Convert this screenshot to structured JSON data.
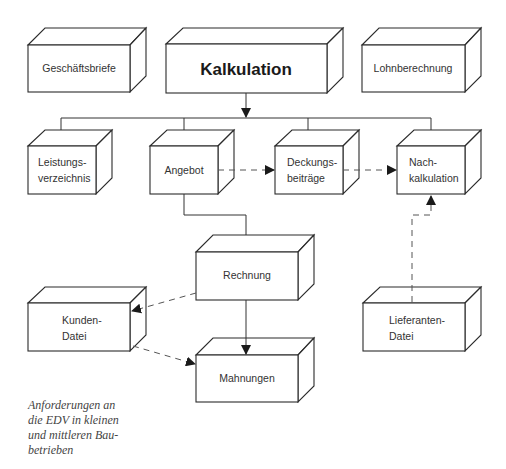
{
  "diagram": {
    "title": "Kalkulation",
    "boxes": {
      "geschaeftsbriefe": {
        "label": "Geschäftsbriefe"
      },
      "kalkulation": {
        "label": "Kalkulation"
      },
      "lohnberechnung": {
        "label": "Lohnberechnung"
      },
      "leistungsverzeichnis": {
        "line1": "Leistungs-",
        "line2": "verzeichnis"
      },
      "angebot": {
        "label": "Angebot"
      },
      "deckungsbeitraege": {
        "line1": "Deckungs-",
        "line2": "beiträge"
      },
      "nachkalkulation": {
        "line1": "Nach-",
        "line2": "kalkulation"
      },
      "rechnung": {
        "label": "Rechnung"
      },
      "kundendatei": {
        "line1": "Kunden-",
        "line2": "Datei"
      },
      "lieferantendatei": {
        "line1": "Lieferanten-",
        "line2": "Datei"
      },
      "mahnungen": {
        "label": "Mahnungen"
      }
    },
    "edges": [
      {
        "from": "Kalkulation",
        "to": "Leistungsverzeichnis",
        "style": "solid"
      },
      {
        "from": "Kalkulation",
        "to": "Angebot",
        "style": "solid"
      },
      {
        "from": "Kalkulation",
        "to": "Deckungsbeiträge",
        "style": "solid"
      },
      {
        "from": "Kalkulation",
        "to": "Nachkalkulation",
        "style": "solid"
      },
      {
        "from": "Angebot",
        "to": "Deckungsbeiträge",
        "style": "dashed"
      },
      {
        "from": "Deckungsbeiträge",
        "to": "Nachkalkulation",
        "style": "dashed"
      },
      {
        "from": "Angebot",
        "to": "Rechnung",
        "style": "solid"
      },
      {
        "from": "Rechnung",
        "to": "Kunden-Datei",
        "style": "dashed"
      },
      {
        "from": "Rechnung",
        "to": "Mahnungen",
        "style": "solid"
      },
      {
        "from": "Kunden-Datei",
        "to": "Mahnungen",
        "style": "dashed"
      },
      {
        "from": "Lieferanten-Datei",
        "to": "Nachkalkulation",
        "style": "dashed"
      }
    ]
  },
  "caption": {
    "lines": [
      "Anforderungen an",
      "die EDV in kleinen",
      "und mittleren Bau-",
      "betrieben"
    ]
  }
}
